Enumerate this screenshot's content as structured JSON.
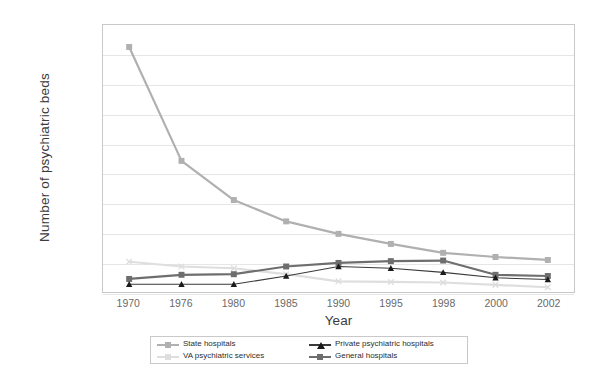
{
  "chart_data": {
    "type": "line",
    "title": "",
    "xlabel": "Year",
    "ylabel": "Number of psychiatric beds",
    "categories": [
      "1970",
      "1976",
      "1980",
      "1985",
      "1990",
      "1995",
      "1998",
      "2000",
      "2002"
    ],
    "ylim": [
      0,
      450000
    ],
    "ytick_values": [
      0,
      50000,
      100000,
      150000,
      200000,
      250000,
      300000,
      350000,
      400000,
      450000
    ],
    "ytick_labels": [
      "0",
      "50,000",
      "100,000",
      "150,000",
      "200,000",
      "250,000",
      "300,000",
      "350,000",
      "400,000",
      "450,000"
    ],
    "grid": "horizontal",
    "legend_position": "bottom",
    "series": [
      {
        "name": "State hospitals",
        "color": "#b0b0b0",
        "marker": "square",
        "marker_color": "#b0b0b0",
        "values": [
          413000,
          221000,
          155000,
          119000,
          98000,
          81000,
          66000,
          59000,
          54000
        ]
      },
      {
        "name": "VA psychiatric services",
        "color": "#dedede",
        "marker": "x",
        "marker_color": "#dedede",
        "values": [
          51000,
          43000,
          40000,
          30000,
          18000,
          17000,
          16000,
          12000,
          8000
        ]
      },
      {
        "name": "Private psychiatric hospitals",
        "color": "#3a3a3a",
        "marker": "triangle",
        "marker_color": "#1a1a1a",
        "values": [
          13000,
          13000,
          13000,
          27000,
          43000,
          40000,
          33000,
          24000,
          21000
        ]
      },
      {
        "name": "General hospitals",
        "color": "#6e6e6e",
        "marker": "square",
        "marker_color": "#6e6e6e",
        "values": [
          22000,
          29000,
          30000,
          43000,
          49000,
          52000,
          53000,
          29000,
          27000
        ]
      }
    ]
  }
}
